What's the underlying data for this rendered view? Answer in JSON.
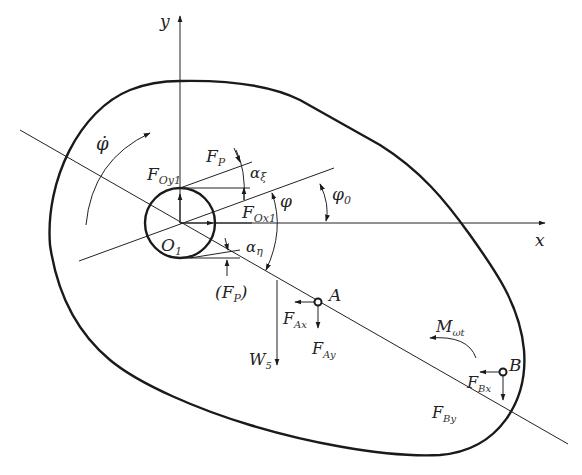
{
  "diagram": {
    "type": "free-body diagram",
    "axes": {
      "x_label": "x",
      "y_label": "y"
    },
    "pivot": {
      "label": "O",
      "sub": "1"
    },
    "angular_velocity": {
      "symbol": "φ̇"
    },
    "angles": {
      "phi": "φ",
      "phi0": {
        "base": "φ",
        "sub": "0"
      },
      "alpha_xi": {
        "base": "α",
        "sub": "ξ"
      },
      "alpha_eta": {
        "base": "α",
        "sub": "η"
      }
    },
    "forces": {
      "FOy1": {
        "base": "F",
        "sub": "Oy1"
      },
      "FOx1": {
        "base": "F",
        "sub": "Ox1"
      },
      "FP": {
        "base": "F",
        "sub": "P"
      },
      "FP_alt": {
        "open": "(",
        "base": "F",
        "sub": "P",
        "close": ")"
      },
      "FAx": {
        "base": "F",
        "sub": "Ax"
      },
      "FAy": {
        "base": "F",
        "sub": "Ay"
      },
      "FBx": {
        "base": "F",
        "sub": "Bx"
      },
      "FBy": {
        "base": "F",
        "sub": "By"
      },
      "W5": {
        "base": "W",
        "sub": "5"
      }
    },
    "points": {
      "A": "A",
      "B": "B"
    },
    "moment": {
      "base": "M",
      "sub": "ωt"
    }
  }
}
